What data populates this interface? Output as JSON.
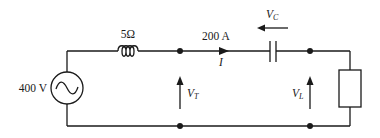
{
  "diagram": {
    "type": "circuit",
    "colors": {
      "stroke": "#1a1a1a",
      "background": "#ffffff"
    },
    "source": {
      "label": "400 V",
      "symbol": "~"
    },
    "inductor": {
      "label": "5Ω"
    },
    "current": {
      "value_label": "200 A",
      "symbol": "I"
    },
    "capacitor": {
      "voltage_symbol": "V",
      "voltage_subscript": "C"
    },
    "terminal_voltage": {
      "symbol": "V",
      "subscript": "T"
    },
    "load_voltage": {
      "symbol": "V",
      "subscript": "L"
    },
    "load": {
      "label": ""
    }
  }
}
